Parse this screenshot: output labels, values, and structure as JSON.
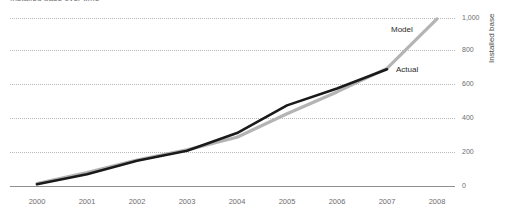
{
  "chart_data": {
    "type": "line",
    "title": "Installed base over time",
    "xlabel": "",
    "ylabel": "Installed base",
    "grid": true,
    "legend_position": "inline-annotation",
    "x": [
      2000,
      2001,
      2002,
      2003,
      2004,
      2005,
      2006,
      2007,
      2008
    ],
    "xtick_labels": [
      "2000",
      "2001",
      "2002",
      "2003",
      "2004",
      "2005",
      "2006",
      "2007",
      "2008"
    ],
    "ytick_labels": [
      "1,000",
      "800",
      "600",
      "400",
      "200",
      "0"
    ],
    "ytick_values": [
      1000,
      800,
      600,
      400,
      200,
      0
    ],
    "ylim": [
      0,
      1050
    ],
    "xlim": [
      2000,
      2008
    ],
    "series": [
      {
        "name": "Model",
        "color": "#b4b4b4",
        "x": [
          2000,
          2001,
          2002,
          2003,
          2004,
          2005,
          2006,
          2007,
          2008
        ],
        "values": [
          15,
          80,
          155,
          215,
          290,
          430,
          560,
          700,
          995
        ]
      },
      {
        "name": "Actual",
        "color": "#1a1a1a",
        "x": [
          2000,
          2001,
          2002,
          2003,
          2004,
          2005,
          2006,
          2007
        ],
        "values": [
          10,
          70,
          150,
          210,
          315,
          480,
          580,
          695
        ]
      }
    ],
    "annotations": [
      {
        "text": "Model",
        "series": "Model"
      },
      {
        "text": "Actual",
        "series": "Actual"
      }
    ]
  },
  "axis": {
    "y_axis_title": "Installed base"
  }
}
